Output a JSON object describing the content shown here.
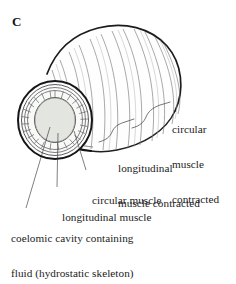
{
  "figure": {
    "panel_label": "C",
    "colors": {
      "outline": "#1a1a1a",
      "ring_line": "#6e6e6e",
      "coelom_fill": "#e2e4e0",
      "muscle_fill": "#f7f7f5",
      "background": "#ffffff",
      "text": "#1c1c1c"
    }
  },
  "labels": {
    "circular_muscle_contracted": {
      "line1": "circular",
      "line2": "muscle",
      "line3": "contracted"
    },
    "longitudinal_muscle_contracted": {
      "line1": "longitudinal",
      "line2": "muscle contracted"
    },
    "circular_muscle": {
      "line1": "circular muscle"
    },
    "longitudinal_muscle": {
      "line1": "longitudinal muscle"
    },
    "coelomic_cavity": {
      "line1": "coelomic cavity containing",
      "line2": "fluid (hydrostatic skeleton)"
    }
  }
}
